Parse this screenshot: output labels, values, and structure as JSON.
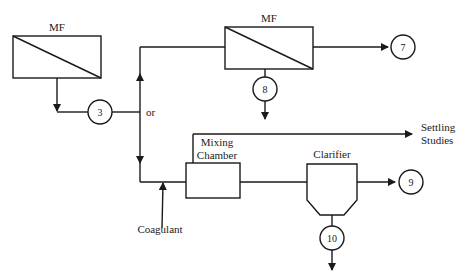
{
  "diagram": {
    "type": "process-flow",
    "units": {
      "mf_left": {
        "label": "MF"
      },
      "mf_right": {
        "label": "MF"
      },
      "mixing_chamber": {
        "label_line1": "Mixing",
        "label_line2": "Chamber"
      },
      "clarifier": {
        "label": "Clarifier"
      }
    },
    "streams": {
      "s3": "3",
      "s7": "7",
      "s8": "8",
      "s9": "9",
      "s10": "10"
    },
    "labels": {
      "or": "or",
      "coagulant": "Coagulant",
      "settling_line1": "Settling",
      "settling_line2": "Studies"
    },
    "colors": {
      "line": "#1a1a1a",
      "background": "#ffffff"
    }
  }
}
